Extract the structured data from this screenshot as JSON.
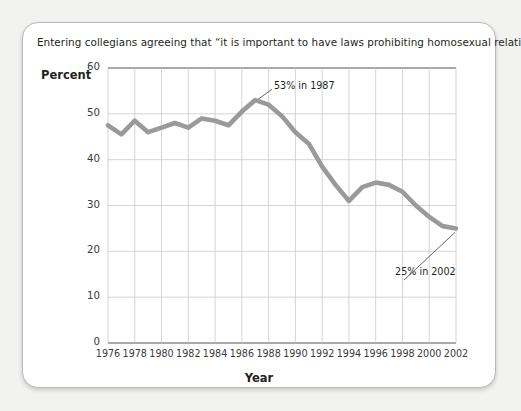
{
  "card": {
    "caption": "Entering collegians agreeing that “it is important to have laws prohibiting homosexual relationships.”",
    "percent_axis_title": "Percent",
    "year_axis_title": "Year"
  },
  "colors": {
    "line": "#9a9a9a",
    "grid": "#c9c9c9",
    "axis": "#8d8d8d",
    "text": "#231f20",
    "page_background": "#f2f2f0",
    "card_background": "#ffffff",
    "card_border": "#b9b9b9"
  },
  "chart_data": {
    "type": "line",
    "title": "Entering collegians agreeing that “it is important to have laws prohibiting homosexual relationships.”",
    "xlabel": "Year",
    "ylabel": "Percent",
    "xlim": [
      1976,
      2002
    ],
    "ylim": [
      0,
      60
    ],
    "yticks": [
      0,
      10,
      20,
      30,
      40,
      50,
      60
    ],
    "xticks": [
      1976,
      1978,
      1980,
      1982,
      1984,
      1986,
      1988,
      1990,
      1992,
      1994,
      1996,
      1998,
      2000,
      2002
    ],
    "grid": true,
    "legend": null,
    "series": [
      {
        "name": "Percent agreeing",
        "x": [
          1976,
          1977,
          1978,
          1979,
          1980,
          1981,
          1982,
          1983,
          1984,
          1985,
          1986,
          1987,
          1988,
          1989,
          1990,
          1991,
          1992,
          1993,
          1994,
          1995,
          1996,
          1997,
          1998,
          1999,
          2000,
          2001,
          2002
        ],
        "values": [
          47.5,
          45.5,
          48.5,
          46.0,
          47.0,
          48.0,
          47.0,
          49.0,
          48.5,
          47.5,
          50.5,
          53.0,
          52.0,
          49.5,
          46.0,
          43.5,
          38.5,
          34.5,
          31.0,
          34.0,
          35.0,
          34.5,
          33.0,
          30.0,
          27.5,
          25.5,
          25.0
        ]
      }
    ],
    "annotations": [
      {
        "label": "53% in 1987",
        "year": 1987,
        "value": 53,
        "text_x": 1988.4,
        "text_y": 56.0
      },
      {
        "label": "25% in 2002",
        "year": 2002,
        "value": 25,
        "text_x": 1997.6,
        "text_y": 15.5
      }
    ]
  },
  "ticks": {
    "y": [
      "60",
      "50",
      "40",
      "30",
      "20",
      "10",
      "0"
    ],
    "x": [
      "1976",
      "1978",
      "1980",
      "1982",
      "1984",
      "1986",
      "1988",
      "1990",
      "1992",
      "1994",
      "1996",
      "1998",
      "2000",
      "2002"
    ]
  },
  "annotation_labels": {
    "peak": "53% in 1987",
    "end": "25% in 2002"
  }
}
